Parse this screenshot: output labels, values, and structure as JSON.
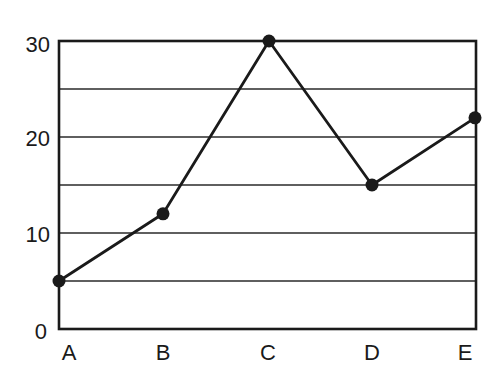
{
  "chart_data": {
    "type": "line",
    "title": "",
    "xlabel": "",
    "ylabel": "",
    "categories": [
      "A",
      "B",
      "C",
      "D",
      "E"
    ],
    "values": [
      5,
      12,
      30,
      15,
      22
    ],
    "ylim": [
      0,
      30
    ],
    "yticks": [
      "0",
      "10",
      "20",
      "30"
    ],
    "grid": true,
    "gridlines_at": [
      5,
      10,
      15,
      20,
      25
    ],
    "markers": "filled-circle",
    "line_color": "#1a1a1a",
    "legend": null
  },
  "axes": {
    "x_labels": [
      "A",
      "B",
      "C",
      "D",
      "E"
    ],
    "y_labels": [
      "0",
      "10",
      "20",
      "30"
    ]
  }
}
